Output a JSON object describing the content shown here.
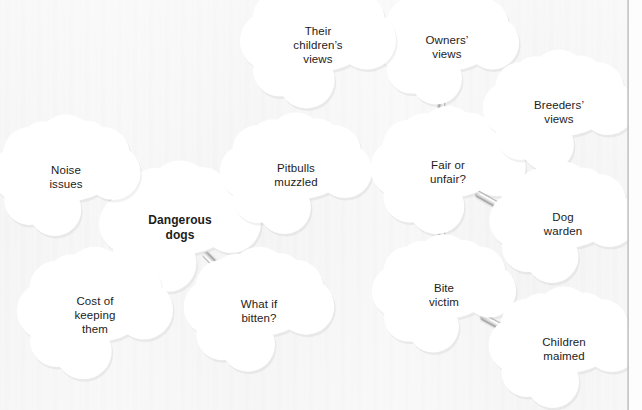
{
  "diagram": {
    "type": "mind-map",
    "style": {
      "node_shape": "cloud",
      "node_fill": "#ffffff",
      "background": "#f7f7f7",
      "text_color": "#1c1c1c",
      "connector_color": "#bdbdbd"
    },
    "nodes": [
      {
        "id": "dangerous-dogs",
        "label": "Dangerous\ndogs",
        "role": "central",
        "bold": true,
        "x": 180,
        "y": 228,
        "w": 122,
        "h": 80
      },
      {
        "id": "noise-issues",
        "label": "Noise\nissues",
        "role": "branch",
        "bold": false,
        "x": 66,
        "y": 177,
        "w": 112,
        "h": 74
      },
      {
        "id": "pitbulls-muzzled",
        "label": "Pitbulls\nmuzzled",
        "role": "branch",
        "bold": false,
        "x": 296,
        "y": 175,
        "w": 116,
        "h": 74
      },
      {
        "id": "cost-of-keeping-them",
        "label": "Cost of\nkeeping\nthem",
        "role": "branch",
        "bold": false,
        "x": 95,
        "y": 315,
        "w": 116,
        "h": 82
      },
      {
        "id": "what-if-bitten",
        "label": "What if\nbitten?",
        "role": "branch",
        "bold": false,
        "x": 259,
        "y": 311,
        "w": 112,
        "h": 76
      },
      {
        "id": "fair-or-unfair",
        "label": "Fair or\nunfair?",
        "role": "branch",
        "bold": false,
        "x": 448,
        "y": 172,
        "w": 116,
        "h": 78
      },
      {
        "id": "owners-views",
        "label": "Owners’\nviews",
        "role": "branch",
        "bold": false,
        "x": 447,
        "y": 47,
        "w": 108,
        "h": 72
      },
      {
        "id": "their-childrens-views",
        "label": "Their\nchildren’s\nviews",
        "role": "branch",
        "bold": false,
        "x": 318,
        "y": 45,
        "w": 116,
        "h": 80
      },
      {
        "id": "breeders-views",
        "label": "Breeders’\nviews",
        "role": "branch",
        "bold": false,
        "x": 559,
        "y": 112,
        "w": 116,
        "h": 74
      },
      {
        "id": "dog-warden",
        "label": "Dog\nwarden",
        "role": "branch",
        "bold": false,
        "x": 563,
        "y": 224,
        "w": 110,
        "h": 74
      },
      {
        "id": "bite-victim",
        "label": "Bite\nvictim",
        "role": "branch",
        "bold": false,
        "x": 444,
        "y": 295,
        "w": 108,
        "h": 72
      },
      {
        "id": "children-maimed",
        "label": "Children\nmaimed",
        "role": "branch",
        "bold": false,
        "x": 564,
        "y": 349,
        "w": 114,
        "h": 74
      }
    ],
    "edges": [
      {
        "from": "noise-issues",
        "to": "dangerous-dogs",
        "x1": 103,
        "y1": 191,
        "x2": 147,
        "y2": 215
      },
      {
        "from": "pitbulls-muzzled",
        "to": "dangerous-dogs",
        "x1": 247,
        "y1": 169,
        "x2": 209,
        "y2": 206
      },
      {
        "from": "cost-of-keeping-them",
        "to": "dangerous-dogs",
        "x1": 118,
        "y1": 288,
        "x2": 160,
        "y2": 253
      },
      {
        "from": "what-if-bitten",
        "to": "dangerous-dogs",
        "x1": 238,
        "y1": 288,
        "x2": 204,
        "y2": 253
      },
      {
        "from": "pitbulls-muzzled",
        "to": "fair-or-unfair",
        "x1": 334,
        "y1": 165,
        "x2": 411,
        "y2": 165
      },
      {
        "from": "their-childrens-views",
        "to": "owners-views",
        "x1": 351,
        "y1": 48,
        "x2": 411,
        "y2": 48
      },
      {
        "from": "owners-views",
        "to": "fair-or-unfair",
        "x1": 442,
        "y1": 78,
        "x2": 442,
        "y2": 140
      },
      {
        "from": "fair-or-unfair",
        "to": "breeders-views",
        "x1": 476,
        "y1": 155,
        "x2": 524,
        "y2": 127
      },
      {
        "from": "fair-or-unfair",
        "to": "dog-warden",
        "x1": 476,
        "y1": 192,
        "x2": 525,
        "y2": 220
      },
      {
        "from": "fair-or-unfair",
        "to": "bite-victim",
        "x1": 442,
        "y1": 205,
        "x2": 442,
        "y2": 268
      },
      {
        "from": "bite-victim",
        "to": "children-maimed",
        "x1": 481,
        "y1": 315,
        "x2": 528,
        "y2": 341
      }
    ]
  }
}
